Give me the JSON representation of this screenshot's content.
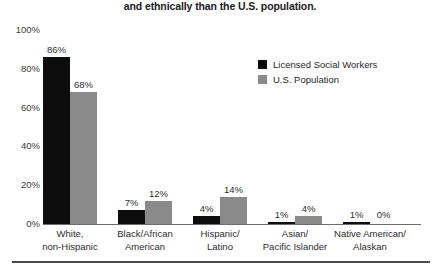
{
  "title": {
    "line_previous_partial": "The social work workforce is less diverse racially",
    "line_visible": "and ethnically than the U.S. population."
  },
  "legend": {
    "position": "top-right",
    "entries": [
      {
        "label": "Licensed Social Workers",
        "color": "#0d0d0d",
        "swatch": "square-swatch"
      },
      {
        "label": "U.S. Population",
        "color": "#8a8a8a",
        "swatch": "square-swatch"
      }
    ]
  },
  "axis": {
    "yticks": [
      "100%",
      "80%",
      "60%",
      "40%",
      "20%",
      "0%"
    ]
  },
  "chart_data": {
    "type": "bar",
    "title": "The social work workforce is less diverse racially and ethnically than the U.S. population.",
    "xlabel": "",
    "ylabel": "",
    "ylim": [
      0,
      100
    ],
    "yticks": [
      0,
      20,
      40,
      60,
      80,
      100
    ],
    "ytick_labels": [
      "0%",
      "20%",
      "40%",
      "60%",
      "80%",
      "100%"
    ],
    "grid": false,
    "legend_position": "top-right",
    "categories": [
      "White, non-Hispanic",
      "Black/African American",
      "Hispanic/ Latino",
      "Asian/ Pacific Islander",
      "Native American/ Alaskan"
    ],
    "category_lines": [
      [
        "White,",
        "non-Hispanic"
      ],
      [
        "Black/African",
        "American"
      ],
      [
        "Hispanic/",
        "Latino"
      ],
      [
        "Asian/",
        "Pacific Islander"
      ],
      [
        "Native American/",
        "Alaskan"
      ]
    ],
    "series": [
      {
        "name": "Licensed Social Workers",
        "color": "#0d0d0d",
        "values": [
          86,
          7,
          4,
          1,
          1
        ],
        "value_labels": [
          "86%",
          "7%",
          "4%",
          "1%",
          "1%"
        ]
      },
      {
        "name": "U.S. Population",
        "color": "#8a8a8a",
        "values": [
          68,
          12,
          14,
          4,
          0
        ],
        "value_labels": [
          "68%",
          "12%",
          "14%",
          "4%",
          "0%"
        ]
      }
    ]
  }
}
